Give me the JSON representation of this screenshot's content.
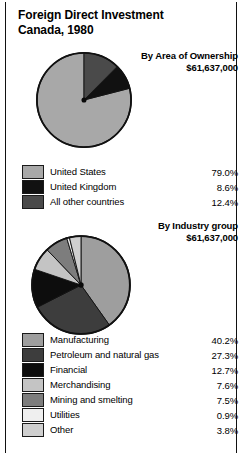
{
  "title": {
    "line1": "Foreign Direct Investment",
    "line2": "Canada, 1980"
  },
  "sections": [
    {
      "heading": "By Area of Ownership",
      "amount": "$61,637,000"
    },
    {
      "heading": "By Industry group",
      "amount": "$61,637,000"
    }
  ],
  "chart_data": [
    {
      "type": "pie",
      "title": "By Area of Ownership",
      "subtitle": "$61,637,000",
      "categories": [
        "United States",
        "United Kingdom",
        "All other countries"
      ],
      "values": [
        79.0,
        8.6,
        12.4
      ],
      "labels": [
        "79.0%",
        "8.6%",
        "12.4%"
      ],
      "colors": [
        "#a8a8a8",
        "#111111",
        "#4a4a4a"
      ],
      "unit": "percent",
      "legend_position": "below"
    },
    {
      "type": "pie",
      "title": "By Industry group",
      "subtitle": "$61,637,000",
      "categories": [
        "Manufacturing",
        "Petroleum and natural gas",
        "Financial",
        "Merchandising",
        "Mining and smelting",
        "Utilities",
        "Other"
      ],
      "values": [
        40.2,
        27.3,
        12.7,
        7.6,
        7.5,
        0.9,
        3.8
      ],
      "labels": [
        "40.2%",
        "27.3%",
        "12.7%",
        "7.6%",
        "7.5%",
        "0.9%",
        "3.8%"
      ],
      "colors": [
        "#9e9e9e",
        "#3d3d3d",
        "#0d0d0d",
        "#c4c4c4",
        "#7d7d7d",
        "#efefef",
        "#cfcfcf"
      ],
      "unit": "percent",
      "legend_position": "below"
    }
  ],
  "legend1": {
    "rows": [
      {
        "label": "United States",
        "value": "79.0%"
      },
      {
        "label": "United Kingdom",
        "value": "8.6%"
      },
      {
        "label": "All other countries",
        "value": "12.4%"
      }
    ]
  },
  "legend2": {
    "rows": [
      {
        "label": "Manufacturing",
        "value": "40.2%"
      },
      {
        "label": "Petroleum and natural gas",
        "value": "27.3%"
      },
      {
        "label": "Financial",
        "value": "12.7%"
      },
      {
        "label": "Merchandising",
        "value": "7.6%"
      },
      {
        "label": "Mining and smelting",
        "value": "7.5%"
      },
      {
        "label": "Utilities",
        "value": "0.9%"
      },
      {
        "label": "Other",
        "value": "3.8%"
      }
    ]
  }
}
